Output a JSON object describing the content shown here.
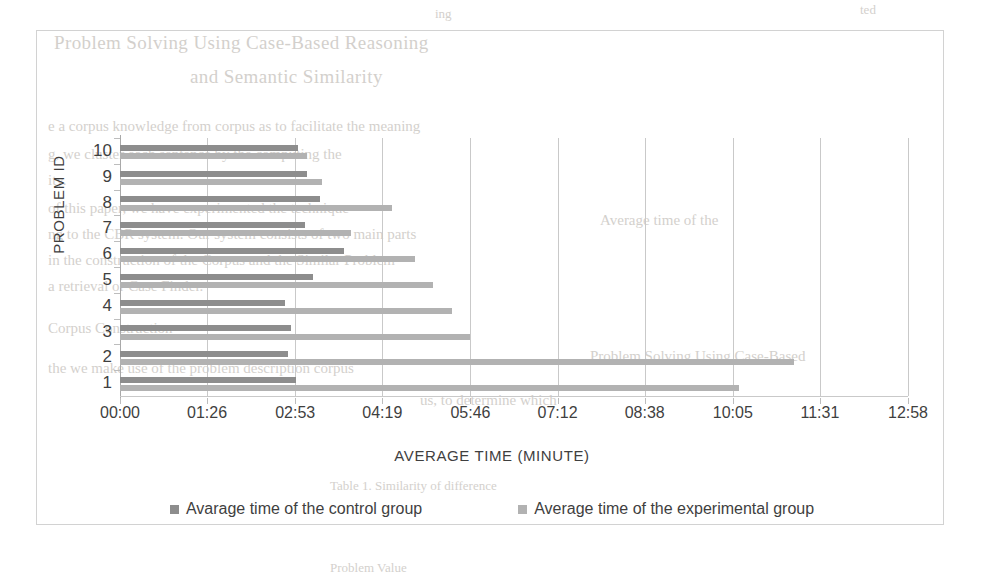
{
  "chart_data": {
    "type": "bar",
    "orientation": "horizontal",
    "title": "",
    "xlabel": "AVERAGE TIME (MINUTE)",
    "ylabel": "PROBLEM ID",
    "categories": [
      "1",
      "2",
      "3",
      "4",
      "5",
      "6",
      "7",
      "8",
      "9",
      "10"
    ],
    "xticklabels": [
      "00:00",
      "01:26",
      "02:53",
      "04:19",
      "05:46",
      "07:12",
      "08:38",
      "10:05",
      "11:31",
      "12:58"
    ],
    "xtick_minutes": [
      0,
      86,
      173,
      259,
      346,
      432,
      518,
      605,
      691,
      778
    ],
    "xlim_minutes": [
      0,
      778
    ],
    "grid": true,
    "legend_position": "bottom",
    "series": [
      {
        "name": "Avarage time of the control group",
        "color": "#8d8d8d",
        "values_minutes": [
          174,
          166,
          169,
          163,
          191,
          221,
          183,
          197,
          185,
          176
        ],
        "values_time": [
          "02:54",
          "02:46",
          "02:49",
          "02:43",
          "03:11",
          "03:41",
          "03:03",
          "03:17",
          "03:05",
          "02:56"
        ]
      },
      {
        "name": "Average time of the experimental group",
        "color": "#b2b2b2",
        "values_minutes": [
          611,
          665,
          346,
          328,
          309,
          291,
          228,
          269,
          199,
          185
        ],
        "values_time": [
          "10:11",
          "11:05",
          "05:46",
          "05:28",
          "05:09",
          "04:51",
          "03:48",
          "04:29",
          "03:19",
          "03:05"
        ]
      }
    ]
  },
  "legend": {
    "items": [
      {
        "label": "Avarage time of the control group",
        "color": "#8d8d8d"
      },
      {
        "label": "Average time of the experimental group",
        "color": "#b2b2b2"
      }
    ]
  },
  "background_text": {
    "lines": [
      "ing",
      "ted",
      "Problem Solving Using Case-Based Reasoning",
      "and Semantic Similarity",
      "e a corpus knowledge from corpus as to facilitate the meaning",
      "g, we cluster each sentence by the computing the",
      "ity.",
      "of this paper, we have experimented the technique",
      "ng to the CBR system. Our system consists of two main parts",
      "in the construction of the Corpus and the Similar Problem",
      "a retrieval or Case Finder.",
      "Corpus Construction",
      "the we make use of the problem description corpus",
      "us, to determine which",
      "Table 1. Similarity of difference",
      "Problem Solving Using Case-Based",
      "Average time of the",
      "Problem            Value"
    ]
  }
}
